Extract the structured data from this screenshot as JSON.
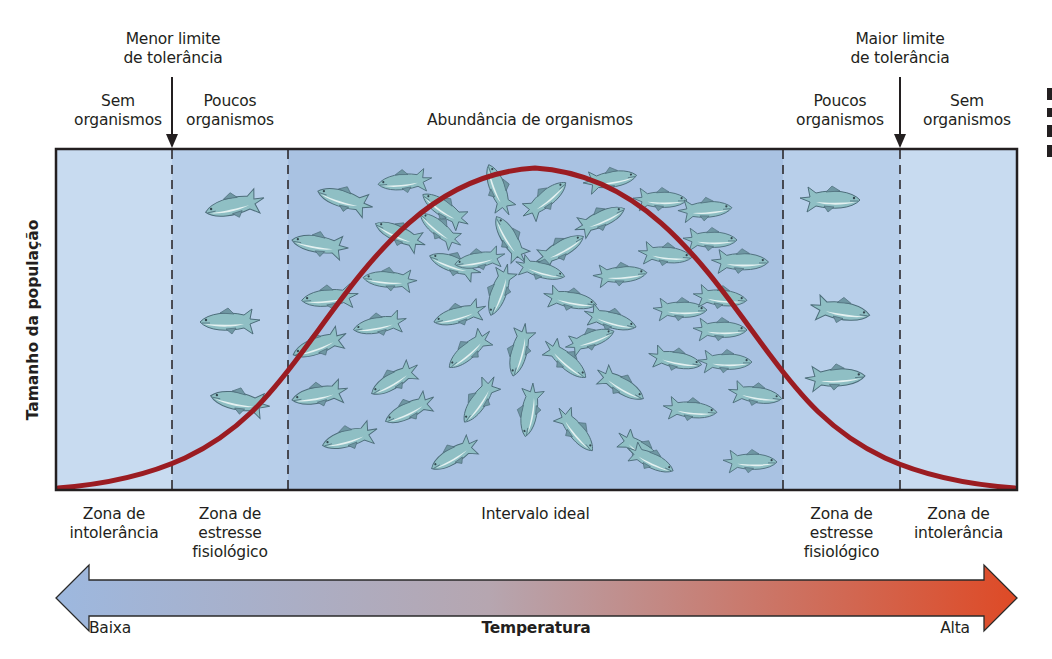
{
  "top_labels": {
    "lower_limit": [
      "Menor limite",
      "de tolerância"
    ],
    "upper_limit": [
      "Maior limite",
      "de tolerância"
    ],
    "left_none": [
      "Sem",
      "organismos"
    ],
    "left_few": [
      "Poucos",
      "organismos"
    ],
    "center_abundance": "Abundância de organismos",
    "right_few": [
      "Poucos",
      "organismos"
    ],
    "right_none": [
      "Sem",
      "organismos"
    ]
  },
  "y_axis_label": "Tamanho da população",
  "zones": [
    {
      "id": "intolerance-low",
      "label": [
        "Zona de",
        "intolerância"
      ],
      "x0": 56,
      "x1": 172,
      "fill": "#c8dbf0"
    },
    {
      "id": "stress-low",
      "label": [
        "Zona de",
        "estresse",
        "fisiológico"
      ],
      "x0": 172,
      "x1": 288,
      "fill": "#b8cfea"
    },
    {
      "id": "ideal",
      "label": [
        "Intervalo ideal"
      ],
      "x0": 288,
      "x1": 783,
      "fill": "#a9c2e2"
    },
    {
      "id": "stress-high",
      "label": [
        "Zona de",
        "estresse",
        "fisiológico"
      ],
      "x0": 783,
      "x1": 900,
      "fill": "#b8cfea"
    },
    {
      "id": "intolerance-high",
      "label": [
        "Zona de",
        "intolerância"
      ],
      "x0": 900,
      "x1": 1017,
      "fill": "#c8dbf0"
    }
  ],
  "temperature_axis": {
    "title": "Temperatura",
    "low_label": "Baixa",
    "high_label": "Alta",
    "low_color": "#9db8df",
    "mid_color": "#b6a6b0",
    "high_color": "#de4a26"
  },
  "colors": {
    "curve": "#9b1c22",
    "frame": "#231f20",
    "fish_body": "#8fbfc4",
    "fish_belly": "#e4f1f1",
    "fish_outline": "#4d6d7a"
  },
  "chart_data": {
    "type": "line",
    "title": "",
    "xlabel": "Temperatura",
    "ylabel": "Tamanho da população",
    "x_categories": [
      "Zona de intolerância",
      "Zona de estresse fisiológico",
      "Intervalo ideal",
      "Zona de estresse fisiológico",
      "Zona de intolerância"
    ],
    "x_extremes": [
      "Baixa",
      "Alta"
    ],
    "series": [
      {
        "name": "Tamanho da população (curva de tolerância)",
        "x": [
          0,
          0.12,
          0.24,
          0.36,
          0.5,
          0.62,
          0.76,
          0.88,
          1.0
        ],
        "y": [
          0.01,
          0.08,
          0.31,
          0.77,
          1.0,
          0.8,
          0.3,
          0.06,
          0.01
        ]
      }
    ],
    "annotations": [
      "Menor limite de tolerância",
      "Maior limite de tolerância",
      "Sem organismos",
      "Poucos organismos",
      "Abundância de organismos",
      "Poucos organismos",
      "Sem organismos"
    ],
    "grid": false,
    "legend": "none"
  },
  "fish": [
    {
      "x": 235,
      "y": 206,
      "r": -12,
      "s": 1.0,
      "f": 1
    },
    {
      "x": 230,
      "y": 322,
      "r": 0,
      "s": 1.0,
      "f": 1
    },
    {
      "x": 240,
      "y": 402,
      "r": 12,
      "s": 1.0,
      "f": 1
    },
    {
      "x": 830,
      "y": 200,
      "r": 0,
      "s": 1.0,
      "f": -1
    },
    {
      "x": 840,
      "y": 311,
      "r": 8,
      "s": 1.0,
      "f": -1
    },
    {
      "x": 835,
      "y": 378,
      "r": -4,
      "s": 1.0,
      "f": -1
    },
    {
      "x": 345,
      "y": 200,
      "r": 18,
      "s": 0.95,
      "f": 1
    },
    {
      "x": 320,
      "y": 245,
      "r": 10,
      "s": 0.95,
      "f": 1
    },
    {
      "x": 330,
      "y": 298,
      "r": -5,
      "s": 0.95,
      "f": 1
    },
    {
      "x": 320,
      "y": 345,
      "r": -20,
      "s": 0.95,
      "f": 1
    },
    {
      "x": 320,
      "y": 395,
      "r": -10,
      "s": 0.95,
      "f": 1
    },
    {
      "x": 350,
      "y": 438,
      "r": -15,
      "s": 0.95,
      "f": 1
    },
    {
      "x": 405,
      "y": 182,
      "r": -5,
      "s": 0.9,
      "f": 1
    },
    {
      "x": 400,
      "y": 235,
      "r": 25,
      "s": 0.9,
      "f": 1
    },
    {
      "x": 390,
      "y": 280,
      "r": 5,
      "s": 0.9,
      "f": 1
    },
    {
      "x": 380,
      "y": 325,
      "r": -10,
      "s": 0.9,
      "f": 1
    },
    {
      "x": 395,
      "y": 380,
      "r": -30,
      "s": 0.9,
      "f": 1
    },
    {
      "x": 410,
      "y": 410,
      "r": -25,
      "s": 0.9,
      "f": 1
    },
    {
      "x": 455,
      "y": 455,
      "r": -30,
      "s": 0.9,
      "f": 1
    },
    {
      "x": 445,
      "y": 210,
      "r": 35,
      "s": 0.9,
      "f": 1
    },
    {
      "x": 455,
      "y": 265,
      "r": 20,
      "s": 0.9,
      "f": 1
    },
    {
      "x": 460,
      "y": 315,
      "r": -15,
      "s": 0.9,
      "f": 1
    },
    {
      "x": 470,
      "y": 350,
      "r": -40,
      "s": 0.9,
      "f": 1
    },
    {
      "x": 480,
      "y": 400,
      "r": -55,
      "s": 0.9,
      "f": 1
    },
    {
      "x": 498,
      "y": 190,
      "r": 70,
      "s": 0.9,
      "f": 1
    },
    {
      "x": 510,
      "y": 240,
      "r": 60,
      "s": 0.9,
      "f": 1
    },
    {
      "x": 500,
      "y": 290,
      "r": -70,
      "s": 0.9,
      "f": 1
    },
    {
      "x": 520,
      "y": 350,
      "r": -75,
      "s": 0.9,
      "f": 1
    },
    {
      "x": 530,
      "y": 410,
      "r": -80,
      "s": 0.9,
      "f": 1
    },
    {
      "x": 545,
      "y": 200,
      "r": -40,
      "s": 0.9,
      "f": -1
    },
    {
      "x": 560,
      "y": 250,
      "r": -30,
      "s": 0.9,
      "f": -1
    },
    {
      "x": 570,
      "y": 300,
      "r": 10,
      "s": 0.9,
      "f": -1
    },
    {
      "x": 565,
      "y": 360,
      "r": 40,
      "s": 0.9,
      "f": -1
    },
    {
      "x": 575,
      "y": 430,
      "r": 50,
      "s": 0.9,
      "f": -1
    },
    {
      "x": 610,
      "y": 180,
      "r": -10,
      "s": 0.9,
      "f": -1
    },
    {
      "x": 600,
      "y": 220,
      "r": -25,
      "s": 0.9,
      "f": -1
    },
    {
      "x": 620,
      "y": 275,
      "r": -5,
      "s": 0.9,
      "f": -1
    },
    {
      "x": 610,
      "y": 320,
      "r": 15,
      "s": 0.9,
      "f": -1
    },
    {
      "x": 620,
      "y": 385,
      "r": 30,
      "s": 0.9,
      "f": -1
    },
    {
      "x": 640,
      "y": 450,
      "r": 35,
      "s": 0.9,
      "f": -1
    },
    {
      "x": 660,
      "y": 200,
      "r": 0,
      "s": 0.9,
      "f": -1
    },
    {
      "x": 665,
      "y": 255,
      "r": 5,
      "s": 0.9,
      "f": -1
    },
    {
      "x": 680,
      "y": 310,
      "r": 0,
      "s": 0.9,
      "f": -1
    },
    {
      "x": 675,
      "y": 360,
      "r": 10,
      "s": 0.9,
      "f": -1
    },
    {
      "x": 690,
      "y": 410,
      "r": 5,
      "s": 0.9,
      "f": -1
    },
    {
      "x": 705,
      "y": 210,
      "r": -5,
      "s": 0.9,
      "f": -1
    },
    {
      "x": 710,
      "y": 240,
      "r": 0,
      "s": 0.9,
      "f": -1
    },
    {
      "x": 740,
      "y": 262,
      "r": 0,
      "s": 0.95,
      "f": -1
    },
    {
      "x": 720,
      "y": 298,
      "r": 5,
      "s": 0.9,
      "f": -1
    },
    {
      "x": 720,
      "y": 330,
      "r": 0,
      "s": 0.9,
      "f": -1
    },
    {
      "x": 725,
      "y": 362,
      "r": 0,
      "s": 0.9,
      "f": -1
    },
    {
      "x": 755,
      "y": 395,
      "r": 8,
      "s": 0.9,
      "f": -1
    },
    {
      "x": 750,
      "y": 462,
      "r": 0,
      "s": 0.9,
      "f": -1
    },
    {
      "x": 650,
      "y": 460,
      "r": 25,
      "s": 0.85,
      "f": -1
    },
    {
      "x": 440,
      "y": 230,
      "r": 40,
      "s": 0.85,
      "f": 1
    },
    {
      "x": 480,
      "y": 260,
      "r": -10,
      "s": 0.85,
      "f": 1
    },
    {
      "x": 540,
      "y": 270,
      "r": 15,
      "s": 0.85,
      "f": -1
    },
    {
      "x": 590,
      "y": 340,
      "r": -20,
      "s": 0.85,
      "f": -1
    }
  ]
}
